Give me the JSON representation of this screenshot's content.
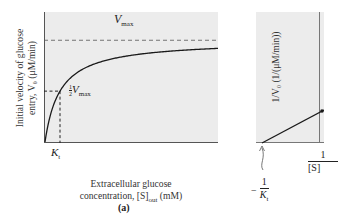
{
  "figure": {
    "panel_a": {
      "label": "(a)",
      "y_axis_label_line1": "Initial velocity of glucose",
      "y_axis_label_line2": "entry, V₀ (μM/min)",
      "x_axis_label_line1": "Extracellular glucose",
      "x_axis_label_line2_main": "concentration, [S]",
      "x_axis_label_line2_sub": "out",
      "x_axis_label_line2_unit": " (mM)",
      "vmax_label_main": "V",
      "vmax_label_sub": "max",
      "half_vmax_num": "1",
      "half_vmax_den": "2",
      "half_vmax_main": "V",
      "half_vmax_sub": "max",
      "kt_label_main": "K",
      "kt_label_sub": "t"
    },
    "panel_b": {
      "y_axis_label": "1/V₀ (1/(μM/min))",
      "x_axis_label_num": "1",
      "x_axis_label_den": "[S]",
      "neg_kt_sign": "−",
      "neg_kt_num": "1",
      "neg_kt_den_main": "K",
      "neg_kt_den_sub": "t"
    },
    "colors": {
      "plot_background": "#ececec",
      "axis": "#555555",
      "curve": "#1a1a1a"
    }
  },
  "chart_data": [
    {
      "type": "line",
      "title": "",
      "xlabel": "Extracellular glucose concentration, [S]out (mM)",
      "ylabel": "Initial velocity of glucose entry, V0 (μM/min)",
      "description": "Michaelis-Menten hyperbola V0 = Vmax[S]/(Kt+[S])",
      "vmax": 1.0,
      "kt": 1.0,
      "xlim": [
        0,
        12
      ],
      "ylim": [
        0,
        1.15
      ],
      "annotations": [
        "Vmax",
        "1/2 Vmax",
        "Kt"
      ],
      "grid": false
    },
    {
      "type": "line",
      "title": "",
      "xlabel": "1/[S]out",
      "ylabel": "1/V0 (1/(μM/min))",
      "description": "Lineweaver-Burk double-reciprocal plot, x-intercept at -1/Kt",
      "annotations": [
        "-1/Kt"
      ],
      "grid": false
    }
  ]
}
